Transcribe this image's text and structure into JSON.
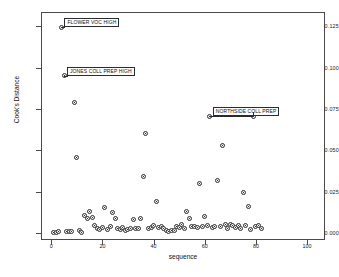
{
  "chart_data": {
    "type": "scatter",
    "title": "",
    "xlabel": "sequence",
    "ylabel": "Cook's Distance",
    "xlim": [
      -4,
      107
    ],
    "ylim": [
      -0.004,
      0.1335
    ],
    "grid": false,
    "legend": null,
    "xticks": [
      0,
      20,
      40,
      60,
      80,
      100
    ],
    "xtick_labels": [
      "0",
      "20",
      "40",
      "60",
      "80",
      "100"
    ],
    "yticks": [
      0.0,
      0.025,
      0.05,
      0.075,
      0.1,
      0.125
    ],
    "ytick_labels": [
      "0.000",
      "0.025",
      "0.050",
      "0.075",
      "0.100",
      "0.125"
    ],
    "marker": "open-circle",
    "marker_color": "#2e2e2e",
    "points": [
      {
        "x": 1,
        "y": 0.0008
      },
      {
        "x": 2,
        "y": 0.0006
      },
      {
        "x": 3,
        "y": 0.0009
      },
      {
        "x": 4,
        "y": 0.1243
      },
      {
        "x": 5,
        "y": 0.0952
      },
      {
        "x": 6,
        "y": 0.0012
      },
      {
        "x": 7,
        "y": 0.0014
      },
      {
        "x": 8,
        "y": 0.001
      },
      {
        "x": 9,
        "y": 0.079
      },
      {
        "x": 10,
        "y": 0.0455
      },
      {
        "x": 11,
        "y": 0.0016
      },
      {
        "x": 12,
        "y": 0.0004
      },
      {
        "x": 13,
        "y": 0.0105
      },
      {
        "x": 14,
        "y": 0.009
      },
      {
        "x": 15,
        "y": 0.0133
      },
      {
        "x": 16,
        "y": 0.0098
      },
      {
        "x": 17,
        "y": 0.005
      },
      {
        "x": 18,
        "y": 0.0028
      },
      {
        "x": 19,
        "y": 0.0022
      },
      {
        "x": 20,
        "y": 0.0033
      },
      {
        "x": 21,
        "y": 0.0157
      },
      {
        "x": 22,
        "y": 0.0026
      },
      {
        "x": 23,
        "y": 0.004
      },
      {
        "x": 24,
        "y": 0.0128
      },
      {
        "x": 25,
        "y": 0.0088
      },
      {
        "x": 26,
        "y": 0.003
      },
      {
        "x": 27,
        "y": 0.0024
      },
      {
        "x": 28,
        "y": 0.0034
      },
      {
        "x": 29,
        "y": 0.002
      },
      {
        "x": 30,
        "y": 0.0025
      },
      {
        "x": 31,
        "y": 0.003
      },
      {
        "x": 32,
        "y": 0.0086
      },
      {
        "x": 33,
        "y": 0.0031
      },
      {
        "x": 34,
        "y": 0.0029
      },
      {
        "x": 35,
        "y": 0.009
      },
      {
        "x": 36,
        "y": 0.0343
      },
      {
        "x": 37,
        "y": 0.0603
      },
      {
        "x": 38,
        "y": 0.003
      },
      {
        "x": 39,
        "y": 0.0038
      },
      {
        "x": 40,
        "y": 0.0046
      },
      {
        "x": 41,
        "y": 0.019
      },
      {
        "x": 42,
        "y": 0.0035
      },
      {
        "x": 43,
        "y": 0.0044
      },
      {
        "x": 44,
        "y": 0.003
      },
      {
        "x": 45,
        "y": 0.0016
      },
      {
        "x": 46,
        "y": 0.0014
      },
      {
        "x": 47,
        "y": 0.0018
      },
      {
        "x": 48,
        "y": 0.002
      },
      {
        "x": 49,
        "y": 0.0042
      },
      {
        "x": 50,
        "y": 0.0038
      },
      {
        "x": 51,
        "y": 0.0053
      },
      {
        "x": 52,
        "y": 0.003
      },
      {
        "x": 53,
        "y": 0.0131
      },
      {
        "x": 54,
        "y": 0.0088
      },
      {
        "x": 55,
        "y": 0.004
      },
      {
        "x": 56,
        "y": 0.0042
      },
      {
        "x": 57,
        "y": 0.0036
      },
      {
        "x": 58,
        "y": 0.0298
      },
      {
        "x": 59,
        "y": 0.0044
      },
      {
        "x": 60,
        "y": 0.01
      },
      {
        "x": 61,
        "y": 0.0048
      },
      {
        "x": 62,
        "y": 0.0705
      },
      {
        "x": 63,
        "y": 0.0036
      },
      {
        "x": 64,
        "y": 0.0042
      },
      {
        "x": 65,
        "y": 0.0318
      },
      {
        "x": 66,
        "y": 0.004
      },
      {
        "x": 67,
        "y": 0.0531
      },
      {
        "x": 68,
        "y": 0.0055
      },
      {
        "x": 69,
        "y": 0.003
      },
      {
        "x": 70,
        "y": 0.0052
      },
      {
        "x": 71,
        "y": 0.0046
      },
      {
        "x": 72,
        "y": 0.0036
      },
      {
        "x": 73,
        "y": 0.005
      },
      {
        "x": 74,
        "y": 0.003
      },
      {
        "x": 75,
        "y": 0.0245
      },
      {
        "x": 76,
        "y": 0.0048
      },
      {
        "x": 77,
        "y": 0.016
      },
      {
        "x": 78,
        "y": 0.0024
      },
      {
        "x": 79,
        "y": 0.0705
      },
      {
        "x": 80,
        "y": 0.004
      },
      {
        "x": 81,
        "y": 0.0046
      },
      {
        "x": 82,
        "y": 0.003
      }
    ],
    "annotations": [
      {
        "label": "FLOWER VOC HIGH",
        "point_x": 4,
        "point_y": 0.1243
      },
      {
        "label": "JONES COLL PREP HIGH",
        "point_x": 5,
        "point_y": 0.0952
      },
      {
        "label": "NORTHSIDE COLL PREP",
        "point_x": 62,
        "point_y": 0.0705,
        "second_point_x": 79,
        "second_point_y": 0.0705
      }
    ]
  }
}
